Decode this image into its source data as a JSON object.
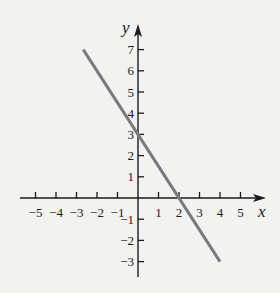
{
  "chart_data": {
    "type": "line",
    "title": "",
    "xlabel": "x",
    "ylabel": "y",
    "xlim": [
      -5.9,
      6.0
    ],
    "ylim": [
      -3.8,
      8.4
    ],
    "grid": false,
    "x_ticks": [
      -5,
      -4,
      -3,
      -2,
      -1,
      1,
      2,
      3,
      4,
      5
    ],
    "y_ticks": [
      7,
      6,
      5,
      4,
      3,
      2,
      1,
      -1,
      -2,
      -3
    ],
    "x_tick_labels": [
      "−5",
      "−4",
      "−3",
      "−2",
      "−1",
      "1",
      "2",
      "3",
      "4",
      "5"
    ],
    "y_tick_labels": [
      "7",
      "6",
      "5",
      "4",
      "3",
      "2",
      "1",
      "−1",
      "−2",
      "−3"
    ],
    "series": [
      {
        "name": "line",
        "equation": "y = -1.5x + 3",
        "x": [
          -2.67,
          4
        ],
        "y": [
          7,
          -3
        ],
        "color": "#7a7a7a"
      }
    ]
  },
  "colors": {
    "background": "#f2f2f0",
    "axis": "#1a1a1a",
    "line": "#7a7a7a"
  }
}
